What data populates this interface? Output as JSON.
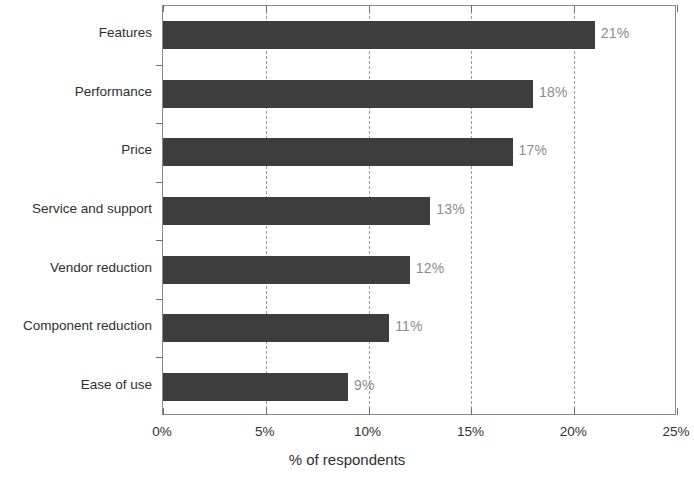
{
  "chart_data": {
    "type": "bar",
    "orientation": "horizontal",
    "title": "",
    "xlabel": "% of respondents",
    "ylabel": "",
    "categories": [
      "Features",
      "Performance",
      "Price",
      "Service and support",
      "Vendor reduction",
      "Component reduction",
      "Ease of use"
    ],
    "values": [
      21,
      18,
      17,
      13,
      12,
      11,
      9
    ],
    "data_labels": [
      "21%",
      "18%",
      "17%",
      "13%",
      "12%",
      "11%",
      "9%"
    ],
    "xlim": [
      0,
      25
    ],
    "xticks": [
      0,
      5,
      10,
      15,
      20,
      25
    ],
    "xtick_labels": [
      "0%",
      "5%",
      "10%",
      "15%",
      "20%",
      "25%"
    ],
    "grid": true,
    "grid_axis": "x",
    "grid_style": "dashed",
    "legend": false,
    "bar_color": "#3d3d3d",
    "grid_color": "#9a9a9a",
    "axis_color": "#8a8a8a",
    "label_color": "#8c8c8c",
    "background": "#ffffff"
  }
}
